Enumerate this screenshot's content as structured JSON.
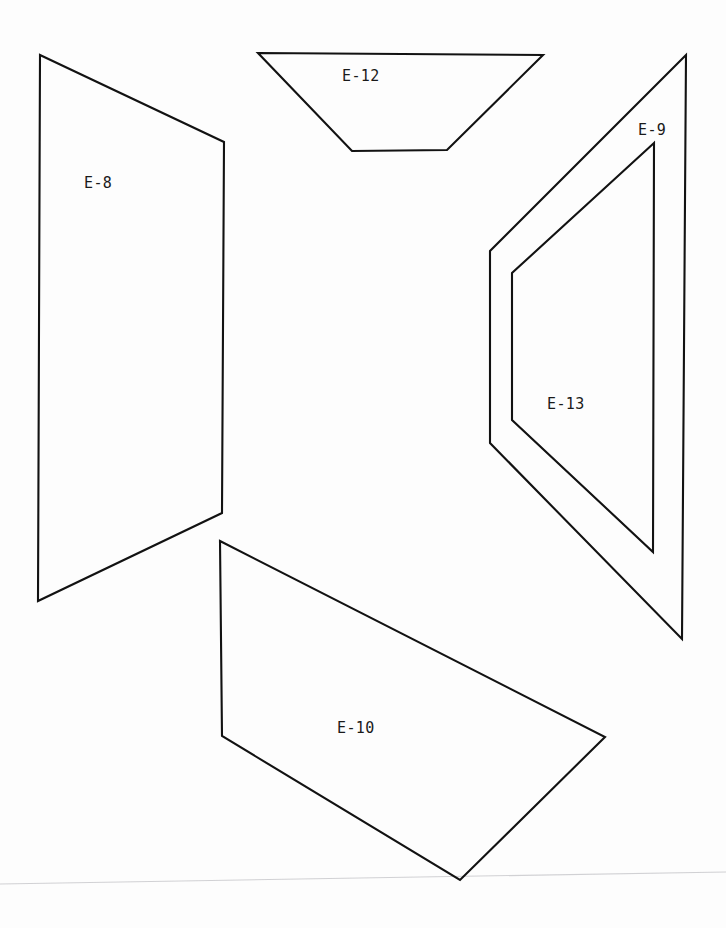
{
  "document": {
    "type": "engineering-panel-layout",
    "background_color": "#fefefe",
    "line_color": "#121212",
    "label_color": "#1a1a1a",
    "width": 726,
    "height": 928
  },
  "panels": [
    {
      "id": "E-8",
      "label": "E-8",
      "shape": "quadrilateral",
      "label_x": 84,
      "label_y": 174,
      "points": "40,55 224,142 222,513 38,601"
    },
    {
      "id": "E-12",
      "label": "E-12",
      "shape": "trapezoid",
      "label_x": 342,
      "label_y": 67,
      "points": "258,53 543,55 447,150 352,151"
    },
    {
      "id": "E-9",
      "label": "E-9",
      "shape": "bent-polygon",
      "label_x": 638,
      "label_y": 121,
      "points": "686,55 490,251 490,443 682,639 686,55"
    },
    {
      "id": "E-13",
      "label": "E-13",
      "shape": "bent-polygon",
      "label_x": 547,
      "label_y": 395,
      "points": "654,143 512,273 512,420 653,552 654,143"
    },
    {
      "id": "E-10",
      "label": "E-10",
      "shape": "quadrilateral",
      "label_x": 337,
      "label_y": 719,
      "points": "220,541 605,737 460,880 222,736"
    }
  ],
  "artifacts": {
    "scan_line": "0,884 726,872"
  }
}
